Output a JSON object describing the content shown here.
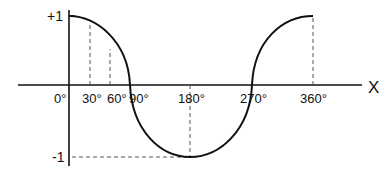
{
  "diagram": {
    "type": "cosine-wave",
    "x_axis_label": "X",
    "y_ticks": [
      {
        "label": "+1",
        "value": 1
      },
      {
        "label": "-1",
        "value": -1
      }
    ],
    "x_ticks": [
      {
        "label": "0°",
        "deg": 0
      },
      {
        "label": "30°",
        "deg": 30
      },
      {
        "label": "60°",
        "deg": 60
      },
      {
        "label": "90°",
        "deg": 90
      },
      {
        "label": "180°",
        "deg": 180
      },
      {
        "label": "270°",
        "deg": 270
      },
      {
        "label": "360°",
        "deg": 360
      }
    ],
    "guide_lines": [
      {
        "deg": 30,
        "style": "dashed"
      },
      {
        "deg": 60,
        "style": "dashed"
      },
      {
        "deg": 180,
        "style": "dashed"
      },
      {
        "deg": 360,
        "style": "dashed"
      },
      {
        "value": -1,
        "style": "dashed-horizontal"
      }
    ],
    "colors": {
      "curve": "#111111",
      "axis": "#111111",
      "guide": "#555555"
    }
  }
}
